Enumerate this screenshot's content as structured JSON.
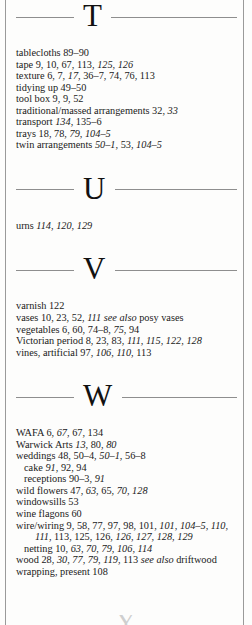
{
  "page": {
    "kind": "book-index-column",
    "background_color": "#fdfdfc",
    "text_color": "#1a1a1a",
    "rule_color": "#8e8e8e"
  },
  "sections": [
    {
      "letter": "T",
      "entries": [
        {
          "indent": "main",
          "parts": [
            {
              "text": "tablecloths 89–90",
              "style": "roman"
            }
          ]
        },
        {
          "indent": "main",
          "parts": [
            {
              "text": "tape 9, 10, 67, 113, ",
              "style": "roman"
            },
            {
              "text": "125, 126",
              "style": "italic"
            }
          ]
        },
        {
          "indent": "main",
          "parts": [
            {
              "text": "texture 6, 7, ",
              "style": "roman"
            },
            {
              "text": "17",
              "style": "italic"
            },
            {
              "text": ", 36–7, 74, 76, 113",
              "style": "roman"
            }
          ]
        },
        {
          "indent": "main",
          "parts": [
            {
              "text": "tidying up 49–50",
              "style": "roman"
            }
          ]
        },
        {
          "indent": "main",
          "parts": [
            {
              "text": "tool box 9, 9, 52",
              "style": "roman"
            }
          ]
        },
        {
          "indent": "main",
          "parts": [
            {
              "text": "traditional/massed arrangements 32, ",
              "style": "roman"
            },
            {
              "text": "33",
              "style": "italic"
            }
          ]
        },
        {
          "indent": "main",
          "parts": [
            {
              "text": "transport ",
              "style": "roman"
            },
            {
              "text": "134",
              "style": "italic"
            },
            {
              "text": ", 135–6",
              "style": "roman"
            }
          ]
        },
        {
          "indent": "main",
          "parts": [
            {
              "text": "trays 18, 78, ",
              "style": "roman"
            },
            {
              "text": "79, 104–5",
              "style": "italic"
            }
          ]
        },
        {
          "indent": "main",
          "parts": [
            {
              "text": "twin arrangements ",
              "style": "roman"
            },
            {
              "text": "50–1",
              "style": "italic"
            },
            {
              "text": ", 53, ",
              "style": "roman"
            },
            {
              "text": "104–5",
              "style": "italic"
            }
          ]
        }
      ]
    },
    {
      "letter": "U",
      "entries": [
        {
          "indent": "main",
          "parts": [
            {
              "text": "urns ",
              "style": "roman"
            },
            {
              "text": "114",
              "style": "italic"
            },
            {
              "text": ", ",
              "style": "roman"
            },
            {
              "text": "120, 129",
              "style": "italic"
            }
          ]
        }
      ]
    },
    {
      "letter": "V",
      "entries": [
        {
          "indent": "main",
          "parts": [
            {
              "text": "varnish 122",
              "style": "roman"
            }
          ]
        },
        {
          "indent": "main",
          "parts": [
            {
              "text": "vases 10, 23, 52, ",
              "style": "roman"
            },
            {
              "text": "111",
              "style": "italic"
            },
            {
              "text": " ",
              "style": "roman"
            },
            {
              "text": "see also",
              "style": "italic"
            },
            {
              "text": " posy vases",
              "style": "roman"
            }
          ]
        },
        {
          "indent": "main",
          "parts": [
            {
              "text": "vegetables 6, 60, 74–8, ",
              "style": "roman"
            },
            {
              "text": "75",
              "style": "italic"
            },
            {
              "text": ", 94",
              "style": "roman"
            }
          ]
        },
        {
          "indent": "main",
          "parts": [
            {
              "text": "Victorian period 8, 23, 83, ",
              "style": "roman"
            },
            {
              "text": "111, 115, 122, 128",
              "style": "italic"
            }
          ]
        },
        {
          "indent": "main",
          "parts": [
            {
              "text": "vines, artificial 97, ",
              "style": "roman"
            },
            {
              "text": "106, 110",
              "style": "italic"
            },
            {
              "text": ", 113",
              "style": "roman"
            }
          ]
        }
      ]
    },
    {
      "letter": "W",
      "entries": [
        {
          "indent": "main",
          "parts": [
            {
              "text": "WAFA 6, ",
              "style": "roman"
            },
            {
              "text": "67",
              "style": "italic"
            },
            {
              "text": ", 67, 134",
              "style": "roman"
            }
          ]
        },
        {
          "indent": "main",
          "parts": [
            {
              "text": "Warwick Arts ",
              "style": "roman"
            },
            {
              "text": "13",
              "style": "italic"
            },
            {
              "text": ", 80, ",
              "style": "roman"
            },
            {
              "text": "80",
              "style": "italic"
            }
          ]
        },
        {
          "indent": "main",
          "parts": [
            {
              "text": "weddings 48, 50–4, ",
              "style": "roman"
            },
            {
              "text": "50–1",
              "style": "italic"
            },
            {
              "text": ", 56–8",
              "style": "roman"
            }
          ]
        },
        {
          "indent": "sub",
          "parts": [
            {
              "text": "cake ",
              "style": "roman"
            },
            {
              "text": "91",
              "style": "italic"
            },
            {
              "text": ", 92, 94",
              "style": "roman"
            }
          ]
        },
        {
          "indent": "sub",
          "parts": [
            {
              "text": "receptions 90–3, ",
              "style": "roman"
            },
            {
              "text": "91",
              "style": "italic"
            }
          ]
        },
        {
          "indent": "main",
          "parts": [
            {
              "text": "wild flowers 47, ",
              "style": "roman"
            },
            {
              "text": "63",
              "style": "italic"
            },
            {
              "text": ", 65, ",
              "style": "roman"
            },
            {
              "text": "70, 128",
              "style": "italic"
            }
          ]
        },
        {
          "indent": "main",
          "parts": [
            {
              "text": "windowsills 53",
              "style": "roman"
            }
          ]
        },
        {
          "indent": "main",
          "parts": [
            {
              "text": "wine flagons 60",
              "style": "roman"
            }
          ]
        },
        {
          "indent": "main",
          "parts": [
            {
              "text": "wire/wiring 9, 58, 77, 97, 98, 101, ",
              "style": "roman"
            },
            {
              "text": "101, 104–5, 110, 111",
              "style": "italic"
            },
            {
              "text": ", 113, 125, 126, ",
              "style": "roman"
            },
            {
              "text": "126, 127, 128, 129",
              "style": "italic"
            }
          ]
        },
        {
          "indent": "sub",
          "parts": [
            {
              "text": "netting 10, ",
              "style": "roman"
            },
            {
              "text": "63, 70, 79, 106, 114",
              "style": "italic"
            }
          ]
        },
        {
          "indent": "main",
          "parts": [
            {
              "text": "wood 28, ",
              "style": "roman"
            },
            {
              "text": "30, 77, 79, 119",
              "style": "italic"
            },
            {
              "text": ", 113 ",
              "style": "roman"
            },
            {
              "text": "see also",
              "style": "italic"
            },
            {
              "text": " driftwood",
              "style": "roman"
            }
          ]
        },
        {
          "indent": "main",
          "parts": [
            {
              "text": "wrapping, present 108",
              "style": "roman"
            }
          ]
        }
      ]
    }
  ],
  "next_section_peek": {
    "letter": "Y"
  }
}
